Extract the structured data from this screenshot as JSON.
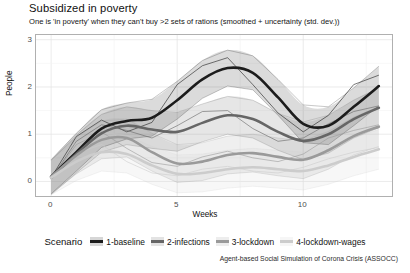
{
  "chart_data": {
    "type": "line",
    "title": "Subsidized in poverty",
    "subtitle": "One is 'in poverty' when they can't buy >2 sets of rations (smoothed + uncertainty (std. dev.))",
    "caption": "Agent-based Social Simulation of Corona Crisis (ASSOCC)",
    "xlabel": "Weeks",
    "ylabel": "People",
    "xlim": [
      -0.6,
      13.6
    ],
    "ylim": [
      -0.35,
      3.1
    ],
    "xticks": [
      0,
      5,
      10
    ],
    "yticks": [
      0,
      1,
      2,
      3
    ],
    "grid": true,
    "legend_title": "Scenario",
    "legend_position": "bottom",
    "smoothed": true,
    "uncertainty": "std. dev.",
    "x": [
      0,
      1,
      2,
      3,
      4,
      5,
      6,
      7,
      8,
      9,
      10,
      11,
      12,
      13
    ],
    "series": [
      {
        "name": "1-baseline",
        "color": "#1c1c1c",
        "values": [
          0.1,
          0.62,
          1.12,
          1.28,
          1.35,
          1.72,
          2.16,
          2.4,
          2.3,
          1.78,
          1.22,
          1.18,
          1.58,
          2.02
        ],
        "upper": [
          0.46,
          1.02,
          1.52,
          1.66,
          1.74,
          2.12,
          2.56,
          2.78,
          2.66,
          2.16,
          1.62,
          1.58,
          1.98,
          2.44
        ],
        "lower": [
          -0.26,
          0.22,
          0.72,
          0.9,
          0.96,
          1.32,
          1.76,
          2.02,
          1.94,
          1.4,
          0.82,
          0.78,
          1.18,
          1.6
        ],
        "raw": [
          0.08,
          0.95,
          1.3,
          1.05,
          1.25,
          2.05,
          2.45,
          2.62,
          2.05,
          1.45,
          1.05,
          1.4,
          2.05,
          2.25
        ]
      },
      {
        "name": "2-infections",
        "color": "#666666",
        "values": [
          0.08,
          0.58,
          1.02,
          1.18,
          1.1,
          1.05,
          1.24,
          1.4,
          1.32,
          1.05,
          0.86,
          1.0,
          1.32,
          1.56
        ],
        "upper": [
          0.44,
          0.98,
          1.42,
          1.58,
          1.5,
          1.46,
          1.64,
          1.8,
          1.72,
          1.44,
          1.26,
          1.4,
          1.72,
          1.98
        ],
        "lower": [
          -0.28,
          0.18,
          0.62,
          0.78,
          0.7,
          0.64,
          0.84,
          1.0,
          0.92,
          0.66,
          0.46,
          0.6,
          0.92,
          1.14
        ],
        "raw": [
          0.05,
          0.85,
          1.2,
          1.08,
          0.92,
          1.18,
          1.48,
          1.5,
          1.12,
          0.85,
          0.92,
          1.22,
          1.48,
          1.6
        ]
      },
      {
        "name": "3-lockdown",
        "color": "#9a9a9a",
        "values": [
          0.1,
          0.55,
          0.88,
          0.92,
          0.62,
          0.38,
          0.42,
          0.56,
          0.6,
          0.52,
          0.46,
          0.66,
          0.96,
          1.16
        ],
        "upper": [
          0.46,
          0.94,
          1.28,
          1.32,
          1.02,
          0.78,
          0.82,
          0.96,
          1.0,
          0.92,
          0.86,
          1.06,
          1.36,
          1.58
        ],
        "lower": [
          -0.26,
          0.16,
          0.48,
          0.52,
          0.22,
          -0.02,
          0.02,
          0.16,
          0.2,
          0.12,
          0.06,
          0.26,
          0.56,
          0.74
        ],
        "raw": [
          0.06,
          0.78,
          1.05,
          0.7,
          0.4,
          0.32,
          0.52,
          0.64,
          0.5,
          0.42,
          0.58,
          0.92,
          1.08,
          1.2
        ]
      },
      {
        "name": "4-lockdown-wages",
        "color": "#cccccc",
        "values": [
          0.08,
          0.42,
          0.62,
          0.58,
          0.34,
          0.16,
          0.18,
          0.26,
          0.3,
          0.26,
          0.22,
          0.34,
          0.52,
          0.68
        ],
        "upper": [
          0.44,
          0.82,
          1.02,
          0.98,
          0.74,
          0.56,
          0.58,
          0.66,
          0.7,
          0.66,
          0.62,
          0.74,
          0.92,
          1.1
        ],
        "lower": [
          -0.28,
          0.02,
          0.22,
          0.18,
          -0.06,
          -0.24,
          -0.22,
          -0.14,
          -0.1,
          -0.14,
          -0.18,
          -0.06,
          0.12,
          0.26
        ],
        "raw": [
          0.04,
          0.6,
          0.78,
          0.42,
          0.18,
          0.12,
          0.26,
          0.32,
          0.22,
          0.18,
          0.3,
          0.48,
          0.62,
          0.72
        ]
      }
    ]
  },
  "legend": {
    "title": "Scenario",
    "items": [
      {
        "label": "1-baseline"
      },
      {
        "label": "2-infections"
      },
      {
        "label": "3-lockdown"
      },
      {
        "label": "4-lockdown-wages"
      }
    ]
  }
}
